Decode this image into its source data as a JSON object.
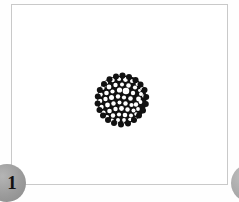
{
  "figure": {
    "panel_name": "figure-panel",
    "background_color": "#ffffff",
    "border_color": "#c9c9c9",
    "caption": "",
    "specimen": {
      "name": "aggregate-specimen",
      "description": "dark rounded aggregate with pale vesicle pores",
      "fill_color": "#111111",
      "pore_color": "#ffffff",
      "shape": "irregular-circle",
      "pore_count": 62
    }
  },
  "badges": {
    "left": {
      "label": "1",
      "color": "#9a9a9a",
      "text_color": "#111111"
    },
    "right": {
      "label": "",
      "color": "#9a9a9a",
      "text_color": "#111111"
    }
  },
  "canvas": {
    "width": 239,
    "height": 202,
    "background_color": "#fefefe"
  }
}
